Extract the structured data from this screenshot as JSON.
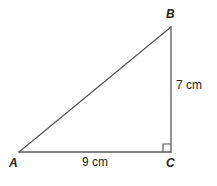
{
  "figure": {
    "name": "right-triangle-abc",
    "background_color": "#ffffff",
    "stroke_color": "#58595b",
    "text_color": "#231f20",
    "vertices": [
      {
        "id": "A",
        "label": "A",
        "x": 19,
        "y": 152
      },
      {
        "id": "B",
        "label": "B",
        "x": 171,
        "y": 27
      },
      {
        "id": "C",
        "label": "C",
        "x": 171,
        "y": 152
      }
    ],
    "sides": [
      {
        "id": "AC",
        "label": "9 cm",
        "value": 9,
        "unit": "cm",
        "from": "A",
        "to": "C"
      },
      {
        "id": "BC",
        "label": "7 cm",
        "value": 7,
        "unit": "cm",
        "from": "B",
        "to": "C"
      },
      {
        "id": "AB",
        "label": "",
        "from": "A",
        "to": "B"
      }
    ],
    "right_angle": {
      "at": "C",
      "marker": "right-angle-square",
      "size": 8
    }
  }
}
